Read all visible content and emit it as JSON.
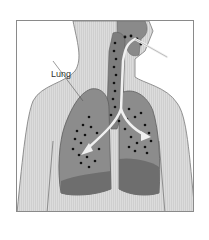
{
  "diagram": {
    "type": "anatomical illustration",
    "labels": [
      {
        "text": "Lung",
        "target": "left-lung"
      }
    ],
    "colors": {
      "body": "#d9d9d9",
      "body_outline": "#7a7a7a",
      "lung": "#8c8c8c",
      "lung_lower_lobe": "#6e6e6e",
      "airway": "#7d7d7d",
      "particles": "#111111",
      "airflow_arrow": "#eeeeee",
      "frame": "#8a8a8a"
    }
  }
}
